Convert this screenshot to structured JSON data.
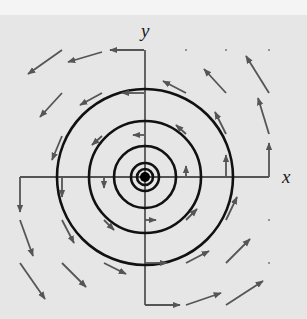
{
  "figure": {
    "title": "",
    "colors": {
      "background": "#e6e6e6",
      "top_band": "#f4f4f4",
      "circles": "#111111",
      "axes": "#555555",
      "arrows": "#555555",
      "center_dot": "#000000"
    },
    "axes": {
      "x_label": "x",
      "y_label": "y"
    },
    "center": {
      "x": 145,
      "y": 177
    },
    "circles_radii_px": [
      8,
      14,
      31,
      56,
      88
    ],
    "center_dot_radius_px": 5,
    "vector_field": {
      "orientation": "counterclockwise",
      "arrows": [
        {
          "x1": 144,
          "y1": 50,
          "x2": 110,
          "y2": 50
        },
        {
          "x1": 102,
          "y1": 52,
          "x2": 68,
          "y2": 62
        },
        {
          "x1": 62,
          "y1": 50,
          "x2": 28,
          "y2": 74
        },
        {
          "x1": 62,
          "y1": 93,
          "x2": 40,
          "y2": 117
        },
        {
          "x1": 102,
          "y1": 93,
          "x2": 80,
          "y2": 105
        },
        {
          "x1": 144,
          "y1": 93,
          "x2": 122,
          "y2": 93
        },
        {
          "x1": 62,
          "y1": 136,
          "x2": 52,
          "y2": 160
        },
        {
          "x1": 102,
          "y1": 136,
          "x2": 92,
          "y2": 145
        },
        {
          "x1": 144,
          "y1": 135,
          "x2": 133,
          "y2": 135
        },
        {
          "x1": 186,
          "y1": 93,
          "x2": 163,
          "y2": 81
        },
        {
          "x1": 226,
          "y1": 93,
          "x2": 204,
          "y2": 69
        },
        {
          "x1": 269,
          "y1": 93,
          "x2": 246,
          "y2": 56
        },
        {
          "x1": 226,
          "y1": 134,
          "x2": 215,
          "y2": 112
        },
        {
          "x1": 269,
          "y1": 134,
          "x2": 258,
          "y2": 98
        },
        {
          "x1": 186,
          "y1": 134,
          "x2": 176,
          "y2": 125
        },
        {
          "x1": 186,
          "y1": 176,
          "x2": 186,
          "y2": 166
        },
        {
          "x1": 226,
          "y1": 176,
          "x2": 226,
          "y2": 155
        },
        {
          "x1": 269,
          "y1": 177,
          "x2": 269,
          "y2": 143
        },
        {
          "x1": 104,
          "y1": 177,
          "x2": 104,
          "y2": 188
        },
        {
          "x1": 62,
          "y1": 177,
          "x2": 62,
          "y2": 197
        },
        {
          "x1": 20,
          "y1": 177,
          "x2": 20,
          "y2": 212
        },
        {
          "x1": 20,
          "y1": 220,
          "x2": 33,
          "y2": 256
        },
        {
          "x1": 62,
          "y1": 220,
          "x2": 74,
          "y2": 243
        },
        {
          "x1": 104,
          "y1": 220,
          "x2": 114,
          "y2": 230
        },
        {
          "x1": 145,
          "y1": 220,
          "x2": 156,
          "y2": 220
        },
        {
          "x1": 20,
          "y1": 263,
          "x2": 45,
          "y2": 299
        },
        {
          "x1": 62,
          "y1": 263,
          "x2": 86,
          "y2": 287
        },
        {
          "x1": 104,
          "y1": 263,
          "x2": 126,
          "y2": 274
        },
        {
          "x1": 145,
          "y1": 263,
          "x2": 167,
          "y2": 263
        },
        {
          "x1": 145,
          "y1": 305,
          "x2": 180,
          "y2": 305
        },
        {
          "x1": 186,
          "y1": 305,
          "x2": 221,
          "y2": 293
        },
        {
          "x1": 226,
          "y1": 305,
          "x2": 263,
          "y2": 281
        },
        {
          "x1": 186,
          "y1": 263,
          "x2": 209,
          "y2": 251
        },
        {
          "x1": 226,
          "y1": 263,
          "x2": 250,
          "y2": 239
        },
        {
          "x1": 186,
          "y1": 220,
          "x2": 197,
          "y2": 209
        },
        {
          "x1": 226,
          "y1": 220,
          "x2": 237,
          "y2": 197
        }
      ],
      "grid_dots": [
        {
          "x": 186,
          "y": 50
        },
        {
          "x": 226,
          "y": 50
        },
        {
          "x": 269,
          "y": 50
        },
        {
          "x": 269,
          "y": 220
        },
        {
          "x": 269,
          "y": 263
        }
      ]
    }
  }
}
